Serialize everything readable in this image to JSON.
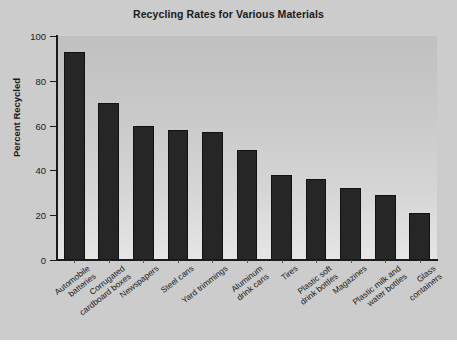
{
  "figure": {
    "background_color": "#cccccc",
    "plot_background_top": "#c0c0c0",
    "plot_background_bottom": "#e6e6e6",
    "bar_color": "#262626",
    "axis_color": "#1a1a1a"
  },
  "chart_data": {
    "type": "bar",
    "title": "Recycling Rates for Various Materials",
    "xlabel": "",
    "ylabel": "Percent Recycled",
    "ylim": [
      0,
      100
    ],
    "yticks": [
      0,
      20,
      40,
      60,
      80,
      100
    ],
    "ytick_labels": [
      "0",
      "20",
      "40",
      "60",
      "80",
      "100"
    ],
    "grid": false,
    "legend": null,
    "categories": [
      "Automobile batteries",
      "Corrugated cardboard boxes",
      "Newspapers",
      "Steel cans",
      "Yard trimmings",
      "Aluminum drink cans",
      "Tires",
      "Plastic soft drink bottles",
      "Magazines",
      "Plastic milk and water bottles",
      "Glass containers"
    ],
    "category_lines": [
      [
        "Automobile",
        "batteries"
      ],
      [
        "Corrugated",
        "cardboard boxes"
      ],
      [
        "Newspapers",
        ""
      ],
      [
        "Steel cans",
        ""
      ],
      [
        "Yard trimmings",
        ""
      ],
      [
        "Aluminum",
        "drink cans"
      ],
      [
        "Tires",
        ""
      ],
      [
        "Plastic soft",
        "drink bottles"
      ],
      [
        "Magazines",
        ""
      ],
      [
        "Plastic milk and",
        "water bottles"
      ],
      [
        "Glass",
        "containers"
      ]
    ],
    "values": [
      93,
      70,
      60,
      58,
      57,
      49,
      38,
      36,
      32,
      29,
      21
    ]
  }
}
